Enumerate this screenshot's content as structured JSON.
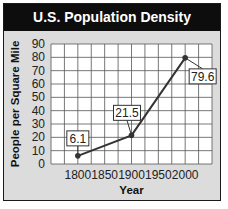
{
  "title": "U.S. Population Density",
  "chart_data": {
    "type": "line",
    "title": "U.S. Population Density",
    "xlabel": "Year",
    "ylabel": "People per Square Mile",
    "x": [
      1800,
      1900,
      2000
    ],
    "series": [
      {
        "name": "U.S. Population Density",
        "values": [
          6.1,
          21.5,
          79.6
        ]
      }
    ],
    "data_labels": [
      "6.1",
      "21.5",
      "79.6"
    ],
    "x_ticks": [
      "1800",
      "1850",
      "1900",
      "1950",
      "2000"
    ],
    "y_ticks": [
      "0",
      "10",
      "20",
      "30",
      "40",
      "50",
      "60",
      "70",
      "80",
      "90"
    ],
    "xlim": [
      1750,
      2050
    ],
    "ylim": [
      0,
      90
    ],
    "grid": true,
    "legend": "none"
  },
  "colors": {
    "title_bar": "#0d0d0d",
    "panel_bg": "#dcdcdc",
    "plot_bg": "#ffffff",
    "line": "#333333"
  }
}
